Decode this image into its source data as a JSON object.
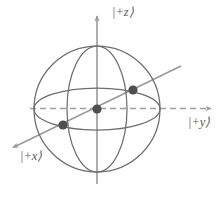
{
  "figure": {
    "name": "bloch-sphere",
    "background_color": "#ffffff"
  },
  "axes": [
    {
      "id": "z",
      "label": "|+z⟩",
      "direction": "up",
      "style": "solid",
      "arrow": true,
      "color": "#9a9a9a",
      "from": [
        97,
        182
      ],
      "to": [
        97,
        14
      ]
    },
    {
      "id": "y",
      "label": "|+y⟩",
      "direction": "right",
      "style": "dashed",
      "arrow": true,
      "color": "#a89ba0",
      "from": [
        30,
        108
      ],
      "to": [
        214,
        108
      ]
    },
    {
      "id": "x",
      "label": "|+x⟩",
      "direction": "lower-left",
      "style": "solid",
      "arrow": true,
      "color": "#9a9a9a",
      "from": [
        181,
        66
      ],
      "to": [
        10,
        149
      ]
    }
  ],
  "sphere": {
    "center": [
      97,
      109
    ],
    "radius": 63,
    "outline_color": "#6e6e6e",
    "equator": {
      "rx": 63,
      "ry": 21,
      "color": "#6e6e6e"
    },
    "meridians": [
      {
        "rx": 30,
        "ry": 63,
        "color": "#6e6e6e"
      },
      {
        "rx": 63,
        "ry": 63,
        "color": "#6e6e6e"
      }
    ]
  },
  "points": [
    {
      "name": "origin-point",
      "cx": 97,
      "cy": 109,
      "r": 4.6,
      "color": "#4f4f4f"
    },
    {
      "name": "x-axis-point-front",
      "cx": 63,
      "cy": 125,
      "r": 4.6,
      "color": "#4f4f4f"
    },
    {
      "name": "x-axis-point-back",
      "cx": 133,
      "cy": 90,
      "r": 4.6,
      "color": "#4f4f4f"
    }
  ],
  "colors": {
    "outline": "#6e6e6e",
    "axis": "#9a9a9a",
    "dashed_axis": "#a89ba0",
    "point": "#4f4f4f",
    "label": "#5a5a5a"
  }
}
